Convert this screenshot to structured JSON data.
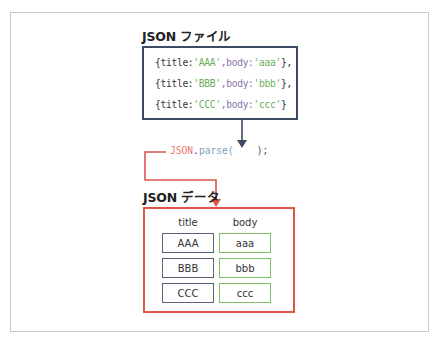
{
  "diagram": {
    "json_file": {
      "heading": "JSON ファイル",
      "lines": [
        {
          "open": "{title:",
          "title_val": "'AAA'",
          "mid": ",body:",
          "body_val": "'aaa'",
          "close": "},"
        },
        {
          "open": "{title:",
          "title_val": "'BBB'",
          "mid": ",body:",
          "body_val": "'bbb'",
          "close": "},"
        },
        {
          "open": "{title:",
          "title_val": "'CCC'",
          "mid": ",body:",
          "body_val": "'ccc'",
          "close": "}"
        }
      ],
      "border_color": "#3d4b63"
    },
    "parse_call": {
      "object": "JSON",
      "dot": ".",
      "method": "parse(",
      "close": "    );"
    },
    "json_data": {
      "heading": "JSON データ",
      "columns": [
        "title",
        "body"
      ],
      "rows": [
        {
          "title": "AAA",
          "body": "aaa"
        },
        {
          "title": "BBB",
          "body": "bbb"
        },
        {
          "title": "CCC",
          "body": "ccc"
        }
      ],
      "border_color": "#e0534c",
      "title_cell_color": "#5a6477",
      "body_cell_color": "#7ec064"
    },
    "colors": {
      "arrow_dark": "#3d4b63",
      "arrow_red": "#e0534c",
      "string_green": "#6cae57"
    }
  }
}
